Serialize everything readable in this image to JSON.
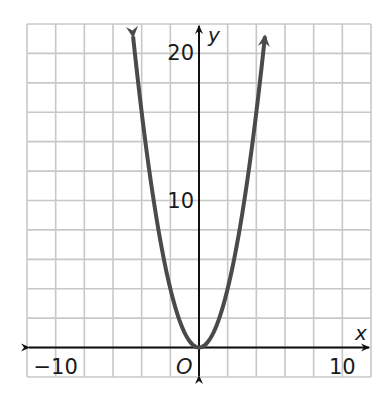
{
  "chart_data": {
    "type": "line",
    "title": "",
    "function": "y = x^2",
    "xlabel": "x",
    "ylabel": "y",
    "origin_label": "O",
    "xlim": [
      -12,
      12
    ],
    "ylim": [
      -2,
      22
    ],
    "grid": true,
    "grid_step_x": 2,
    "grid_step_y": 2,
    "x_tick_labels": [
      {
        "value": -10,
        "label": "−10"
      },
      {
        "value": 10,
        "label": "10"
      }
    ],
    "y_tick_labels": [
      {
        "value": 10,
        "label": "10"
      },
      {
        "value": 20,
        "label": "20"
      }
    ],
    "series": [
      {
        "name": "y = x^2",
        "x": [
          -4.6,
          -4,
          -3,
          -2,
          -1,
          0,
          1,
          2,
          3,
          4,
          4.6
        ],
        "y": [
          21.16,
          16,
          9,
          4,
          1,
          0,
          1,
          4,
          9,
          16,
          21.16
        ],
        "color": "#4a4a4a",
        "arrows_at_ends": true
      }
    ],
    "colors": {
      "grid": "#c8c8c8",
      "axis": "#111111",
      "curve": "#4a4a4a"
    }
  }
}
